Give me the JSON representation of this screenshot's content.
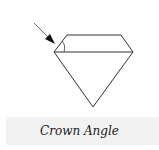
{
  "caption": "Crown Angle",
  "colors": {
    "stroke": "#333333",
    "background": "#ffffff",
    "caption_band": "#f2f2f2"
  },
  "diagram": {
    "indicator": "arrow pointing to crown angle"
  }
}
